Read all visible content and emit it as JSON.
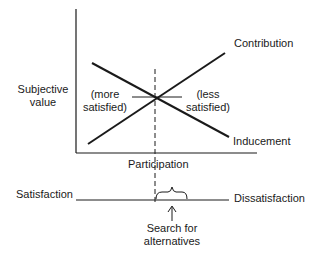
{
  "diagram": {
    "y_axis_label_line1": "Subjective",
    "y_axis_label_line2": "value",
    "x_axis_label": "Participation",
    "curves": {
      "contribution": "Contribution",
      "inducement": "Inducement"
    },
    "regions": {
      "left_line1": "(more",
      "left_line2": "satisfied)",
      "right_line1": "(less",
      "right_line2": "satisfied)"
    },
    "scale": {
      "left_label": "Satisfaction",
      "right_label": "Dissatisfaction"
    },
    "annotation": {
      "line1": "Search for",
      "line2": "alternatives"
    },
    "colors": {
      "ink": "#1a1a1a",
      "background": "#ffffff"
    }
  }
}
